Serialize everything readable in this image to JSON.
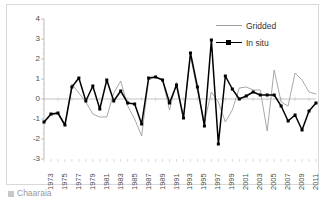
{
  "figure": {
    "caption_bullet": "image-placeholder-icon",
    "caption_text": "Chaaraia"
  },
  "legend": {
    "position": "top-right",
    "items": [
      {
        "label": "Gridded",
        "color": "#9e9e9e",
        "marker": "none"
      },
      {
        "label": "In situ",
        "color": "#000000",
        "marker": "square"
      }
    ]
  },
  "chart_data": {
    "type": "line",
    "title": "",
    "xlabel": "",
    "ylabel": "",
    "ylim": [
      -3,
      4
    ],
    "yticks": [
      4,
      3,
      2,
      1,
      0,
      -1,
      -2,
      -3
    ],
    "grid": false,
    "zero_line": true,
    "x": [
      1973,
      1974,
      1975,
      1976,
      1977,
      1978,
      1979,
      1980,
      1981,
      1982,
      1983,
      1984,
      1985,
      1986,
      1987,
      1988,
      1989,
      1990,
      1991,
      1992,
      1993,
      1994,
      1995,
      1996,
      1997,
      1998,
      1999,
      2000,
      2001,
      2002,
      2003,
      2004,
      2005,
      2006,
      2007,
      2008,
      2009,
      2010,
      2011,
      2012
    ],
    "xtick_labels": [
      "1973",
      "1975",
      "1977",
      "1979",
      "1981",
      "1983",
      "1985",
      "1987",
      "1989",
      "1991",
      "1993",
      "1995",
      "1997",
      "1999",
      "2001",
      "2003",
      "2005",
      "2007",
      "2009",
      "2011"
    ],
    "xtick_values": [
      1973,
      1975,
      1977,
      1979,
      1981,
      1983,
      1985,
      1987,
      1989,
      1991,
      1993,
      1995,
      1997,
      1999,
      2001,
      2003,
      2005,
      2007,
      2009,
      2011
    ],
    "xtick_rotation": -90,
    "series": [
      {
        "name": "In situ",
        "color": "#000000",
        "marker": "square",
        "values": [
          -1.15,
          -0.75,
          -0.7,
          -1.3,
          0.6,
          1.05,
          -0.1,
          0.65,
          -0.5,
          0.95,
          -0.1,
          0.4,
          -0.2,
          -0.25,
          -1.25,
          1.05,
          1.1,
          0.95,
          -0.2,
          0.7,
          -0.95,
          2.3,
          0.6,
          -1.35,
          2.95,
          -2.25,
          1.15,
          0.5,
          0.0,
          0.15,
          0.35,
          0.2,
          0.2,
          0.2,
          -0.35,
          -1.1,
          -0.8,
          -1.55,
          -0.6,
          -0.2
        ]
      },
      {
        "name": "Gridded",
        "color": "#9e9e9e",
        "marker": "none",
        "values": [
          -1.2,
          -0.8,
          -0.75,
          -1.35,
          0.75,
          0.3,
          -0.15,
          -0.75,
          -0.9,
          -0.9,
          0.3,
          0.9,
          -0.35,
          -1.0,
          -1.85,
          0.95,
          1.1,
          0.95,
          -0.55,
          0.85,
          -0.9,
          2.15,
          0.4,
          -1.15,
          0.35,
          -0.15,
          -1.15,
          -0.55,
          0.55,
          0.6,
          0.45,
          0.45,
          -1.6,
          1.45,
          -0.15,
          -0.35,
          1.3,
          0.95,
          0.35,
          0.25
        ]
      }
    ]
  }
}
